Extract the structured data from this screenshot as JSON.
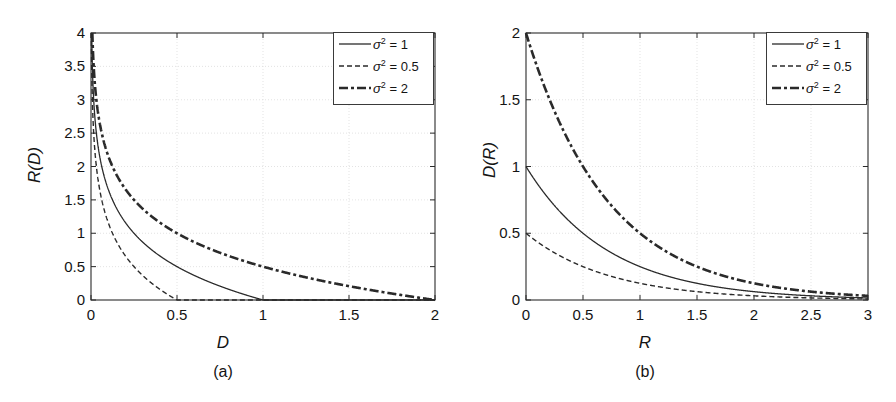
{
  "figure": {
    "background": "#ffffff",
    "line_color": "#2a2a2a",
    "grid_color": "#dcdcdc"
  },
  "panels": [
    {
      "id": "a",
      "caption": "(a)",
      "xlabel": "D",
      "ylabel": "R(D)",
      "xticks": [
        "0",
        "0.5",
        "1",
        "1.5",
        "2"
      ],
      "yticks": [
        "0",
        "0.5",
        "1",
        "1.5",
        "2",
        "2.5",
        "3",
        "3.5",
        "4"
      ],
      "legend": [
        {
          "label_sigma": "σ",
          "label_exp": "2",
          "label_value": "= 1",
          "style": "solid"
        },
        {
          "label_sigma": "σ",
          "label_exp": "2",
          "label_value": "= 0.5",
          "style": "dashed"
        },
        {
          "label_sigma": "σ",
          "label_exp": "2",
          "label_value": "= 2",
          "style": "dashdot"
        }
      ]
    },
    {
      "id": "b",
      "caption": "(b)",
      "xlabel": "R",
      "ylabel": "D(R)",
      "xticks": [
        "0",
        "0.5",
        "1",
        "1.5",
        "2",
        "2.5",
        "3"
      ],
      "yticks": [
        "0",
        "0.5",
        "1",
        "1.5",
        "2"
      ],
      "legend": [
        {
          "label_sigma": "σ",
          "label_exp": "2",
          "label_value": "= 1",
          "style": "solid"
        },
        {
          "label_sigma": "σ",
          "label_exp": "2",
          "label_value": "= 0.5",
          "style": "dashed"
        },
        {
          "label_sigma": "σ",
          "label_exp": "2",
          "label_value": "= 2",
          "style": "dashdot"
        }
      ]
    }
  ],
  "chart_data": [
    {
      "type": "line",
      "title": "",
      "panel": "(a)",
      "xlabel": "D",
      "ylabel": "R(D)",
      "xlim": [
        0,
        2
      ],
      "ylim": [
        0,
        4
      ],
      "xticks": [
        0,
        0.5,
        1,
        1.5,
        2
      ],
      "yticks": [
        0,
        0.5,
        1,
        1.5,
        2,
        2.5,
        3,
        3.5,
        4
      ],
      "grid": true,
      "legend_position": "top-right",
      "formula": "R(D) = max(0, 0.5*log2(sigma^2 / D))",
      "series": [
        {
          "name": "σ² = 1",
          "sigma2": 1,
          "style": "solid",
          "x": [
            0.005,
            0.01,
            0.02,
            0.04,
            0.07,
            0.1,
            0.15,
            0.2,
            0.3,
            0.4,
            0.5,
            0.6,
            0.7,
            0.8,
            0.9,
            1.0,
            1.5,
            2.0
          ],
          "y": [
            3.82,
            3.32,
            2.82,
            2.32,
            1.92,
            1.66,
            1.37,
            1.16,
            0.87,
            0.66,
            0.5,
            0.37,
            0.26,
            0.16,
            0.08,
            0.0,
            0.0,
            0.0
          ]
        },
        {
          "name": "σ² = 0.5",
          "sigma2": 0.5,
          "style": "dashed",
          "x": [
            0.0025,
            0.005,
            0.01,
            0.02,
            0.035,
            0.05,
            0.075,
            0.1,
            0.15,
            0.2,
            0.25,
            0.3,
            0.35,
            0.4,
            0.45,
            0.5,
            1.0,
            2.0
          ],
          "y": [
            3.82,
            3.32,
            2.82,
            2.32,
            1.92,
            1.66,
            1.37,
            1.16,
            0.87,
            0.66,
            0.5,
            0.37,
            0.26,
            0.16,
            0.08,
            0.0,
            0.0,
            0.0
          ]
        },
        {
          "name": "σ² = 2",
          "sigma2": 2,
          "style": "dashdot",
          "x": [
            0.01,
            0.02,
            0.04,
            0.08,
            0.14,
            0.2,
            0.3,
            0.4,
            0.6,
            0.8,
            1.0,
            1.2,
            1.4,
            1.6,
            1.8,
            2.0
          ],
          "y": [
            3.82,
            3.32,
            2.82,
            2.32,
            1.92,
            1.66,
            1.37,
            1.16,
            0.87,
            0.66,
            0.5,
            0.37,
            0.26,
            0.16,
            0.08,
            0.0
          ]
        }
      ]
    },
    {
      "type": "line",
      "title": "",
      "panel": "(b)",
      "xlabel": "R",
      "ylabel": "D(R)",
      "xlim": [
        0,
        3
      ],
      "ylim": [
        0,
        2
      ],
      "xticks": [
        0,
        0.5,
        1,
        1.5,
        2,
        2.5,
        3
      ],
      "yticks": [
        0,
        0.5,
        1,
        1.5,
        2
      ],
      "grid": true,
      "legend_position": "top-right",
      "formula": "D(R) = sigma^2 * 2^(-2R)",
      "series": [
        {
          "name": "σ² = 1",
          "sigma2": 1,
          "style": "solid",
          "x": [
            0,
            0.25,
            0.5,
            0.75,
            1.0,
            1.25,
            1.5,
            1.75,
            2.0,
            2.25,
            2.5,
            2.75,
            3.0
          ],
          "y": [
            1.0,
            0.707,
            0.5,
            0.354,
            0.25,
            0.177,
            0.125,
            0.088,
            0.0625,
            0.044,
            0.031,
            0.022,
            0.0156
          ]
        },
        {
          "name": "σ² = 0.5",
          "sigma2": 0.5,
          "style": "dashed",
          "x": [
            0,
            0.25,
            0.5,
            0.75,
            1.0,
            1.25,
            1.5,
            1.75,
            2.0,
            2.25,
            2.5,
            2.75,
            3.0
          ],
          "y": [
            0.5,
            0.354,
            0.25,
            0.177,
            0.125,
            0.088,
            0.0625,
            0.044,
            0.031,
            0.022,
            0.0156,
            0.011,
            0.0078
          ]
        },
        {
          "name": "σ² = 2",
          "sigma2": 2,
          "style": "dashdot",
          "x": [
            0,
            0.25,
            0.5,
            0.75,
            1.0,
            1.25,
            1.5,
            1.75,
            2.0,
            2.25,
            2.5,
            2.75,
            3.0
          ],
          "y": [
            2.0,
            1.414,
            1.0,
            0.707,
            0.5,
            0.354,
            0.25,
            0.177,
            0.125,
            0.088,
            0.0625,
            0.044,
            0.031
          ]
        }
      ]
    }
  ]
}
